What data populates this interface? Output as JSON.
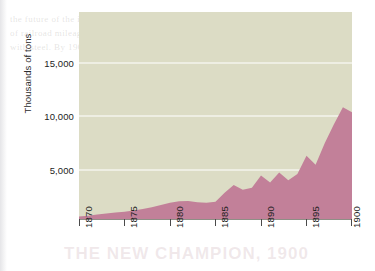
{
  "figure": {
    "colors": {
      "plot_background": "#dcdcc5",
      "area_fill": "#c28099",
      "gridline": "#f4f4ec",
      "axis": "#4a4a4a",
      "text": "#1d1d1d",
      "page_background": "#ffffff"
    }
  },
  "chart_data": {
    "type": "area",
    "title": "",
    "xlabel": "",
    "ylabel": "Thousands of tons",
    "xlim": [
      1870,
      1900
    ],
    "ylim": [
      0,
      19800
    ],
    "grid": true,
    "legend": "none",
    "y_ticks": [
      5000,
      10000,
      15000
    ],
    "y_tick_labels": [
      "5,000",
      "10,000",
      "15,000"
    ],
    "x_ticks": [
      1870,
      1875,
      1880,
      1885,
      1890,
      1895,
      1900
    ],
    "x_tick_labels": [
      "1870",
      "1875",
      "1880",
      "1885",
      "1890",
      "1895",
      "1900"
    ],
    "x": [
      1870,
      1871,
      1872,
      1873,
      1874,
      1875,
      1876,
      1877,
      1878,
      1879,
      1880,
      1881,
      1882,
      1883,
      1884,
      1885,
      1886,
      1887,
      1888,
      1889,
      1890,
      1891,
      1892,
      1893,
      1894,
      1895,
      1896,
      1897,
      1898,
      1899,
      1900
    ],
    "values": [
      250,
      320,
      420,
      530,
      620,
      700,
      820,
      960,
      1120,
      1350,
      1550,
      1700,
      1720,
      1600,
      1550,
      1650,
      2500,
      3250,
      2800,
      3000,
      4150,
      3500,
      4450,
      3700,
      4300,
      6050,
      5200,
      7250,
      9050,
      10700,
      10200
    ],
    "series": [
      {
        "name": "Steel production",
        "values": [
          250,
          320,
          420,
          530,
          620,
          700,
          820,
          960,
          1120,
          1350,
          1550,
          1700,
          1720,
          1600,
          1550,
          1650,
          2500,
          3250,
          2800,
          3000,
          4150,
          3500,
          4450,
          3700,
          4300,
          6050,
          5200,
          7250,
          9050,
          10700,
          10200
        ]
      }
    ]
  },
  "scan_artifacts": {
    "ghost_lines": [
      "the future of the industry was not in doubt; the",
      "of railroad mileage was falling away, but the output",
      "with steel. By 1900 nearly every railway in the country"
    ],
    "ghost_big": "THE NEW CHAMPION, 1900"
  }
}
